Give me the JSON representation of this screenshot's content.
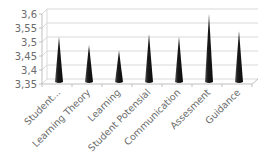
{
  "chart_data": {
    "type": "bar",
    "style": "3d-cone",
    "title": "",
    "xlabel": "",
    "ylabel": "",
    "categories": [
      "Student...",
      "Learning Theory",
      "Learning",
      "Student Potensial",
      "Communication",
      "Assesment",
      "Guidance"
    ],
    "values": [
      3.51,
      3.48,
      3.46,
      3.52,
      3.51,
      3.59,
      3.53
    ],
    "ylim": [
      3.35,
      3.6
    ],
    "yticks": [
      "3,35",
      "3,4",
      "3,45",
      "3,5",
      "3,55",
      "3,6"
    ],
    "ytick_values": [
      3.35,
      3.4,
      3.45,
      3.5,
      3.55,
      3.6
    ],
    "grid": true,
    "legend": "none",
    "colors": {
      "bar": "#1a1a1a",
      "grid": "#d9d9d9",
      "axis": "#bfbfbf",
      "text": "#6b6b6b"
    }
  }
}
